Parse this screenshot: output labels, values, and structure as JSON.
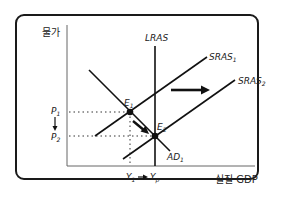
{
  "diagram": {
    "axis_y_label": "물가",
    "axis_x_label": "실질 GDP",
    "curves": {
      "lras": "LRAS",
      "sras1": "SRAS",
      "sras1_sub": "1",
      "sras2": "SRAS",
      "sras2_sub": "2",
      "ad1": "AD",
      "ad1_sub": "1"
    },
    "points": {
      "e1": "E",
      "e1_sub": "1",
      "e2": "E",
      "e2_sub": "2"
    },
    "price_levels": {
      "p1": "P",
      "p1_sub": "1",
      "p2": "P",
      "p2_sub": "2"
    },
    "outputs": {
      "y1": "Y",
      "y1_sub": "1",
      "yp": "Y",
      "yp_sub": "p"
    },
    "colors": {
      "line": "#111111",
      "axis": "#555555",
      "frame": "#1a1a1a"
    }
  }
}
